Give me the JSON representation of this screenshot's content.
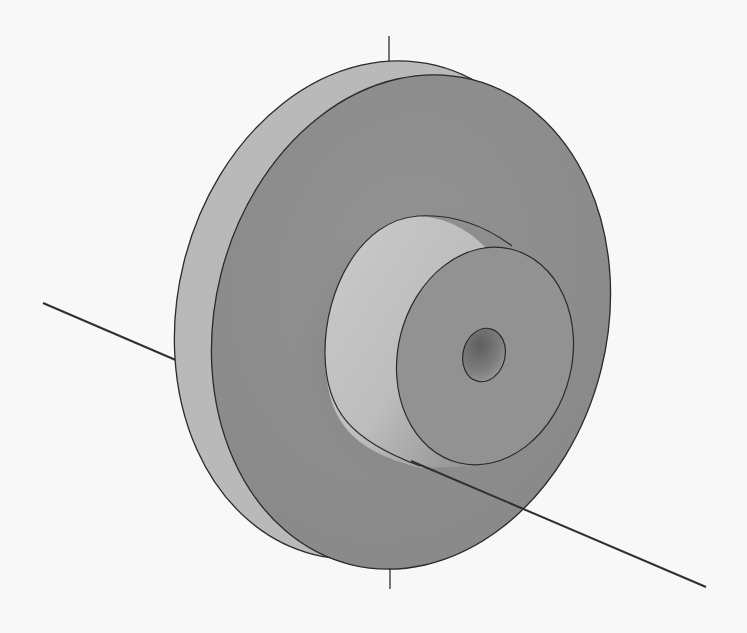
{
  "figure": {
    "type": "3D CAD rendering",
    "caption": ""
  },
  "colors": {
    "background": "#f8f8f8",
    "flange_rim": "#b9b9b9",
    "flange_face": "#8e8e8e",
    "hub_side_light": "#c6c6c6",
    "hub_side_dark": "#9c9c9c",
    "hub_face": "#929292",
    "bore": "#7c7c7c",
    "edge": "#2a2a2a",
    "axis": "#2f2f2f"
  },
  "parts": [
    {
      "name": "flange",
      "label": "Flange disk"
    },
    {
      "name": "hub",
      "label": "Cylindrical hub"
    },
    {
      "name": "bore",
      "label": "Center bore"
    },
    {
      "name": "axis",
      "label": "Rotation axis"
    }
  ]
}
